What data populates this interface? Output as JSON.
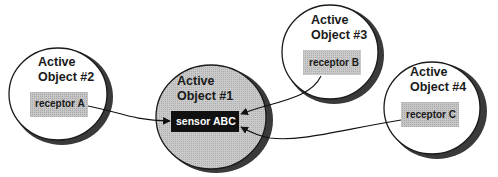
{
  "diagram": {
    "colors": {
      "background": "#ffffff",
      "outline": "#1a1a1a",
      "shadow": "#3a3a3a",
      "central_fill": "#c4c4c4",
      "receptor_fill": "#c8c8c8",
      "sensor_fill": "#111111"
    },
    "objects": [
      {
        "id": "obj1",
        "title_line1": "Active",
        "title_line2": "Object #1",
        "component": "sensor ABC",
        "component_type": "sensor"
      },
      {
        "id": "obj2",
        "title_line1": "Active",
        "title_line2": "Object #2",
        "component": "receptor A",
        "component_type": "receptor"
      },
      {
        "id": "obj3",
        "title_line1": "Active",
        "title_line2": "Object #3",
        "component": "receptor B",
        "component_type": "receptor"
      },
      {
        "id": "obj4",
        "title_line1": "Active",
        "title_line2": "Object #4",
        "component": "receptor C",
        "component_type": "receptor"
      }
    ],
    "connections": [
      {
        "from": "receptor A",
        "to": "sensor ABC"
      },
      {
        "from": "receptor B",
        "to": "sensor ABC"
      },
      {
        "from": "receptor C",
        "to": "sensor ABC"
      }
    ]
  }
}
